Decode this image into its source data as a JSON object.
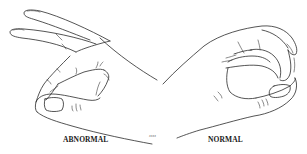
{
  "figure": {
    "line_color": "#2a2a2a",
    "background_color": "#ffffff",
    "left_panel": {
      "label": "ABNORMAL",
      "depiction": "hand-abnormal-pinch"
    },
    "right_panel": {
      "label": "NORMAL",
      "depiction": "hand-normal-pinch"
    },
    "signature": "ɜɜɜɜ"
  }
}
